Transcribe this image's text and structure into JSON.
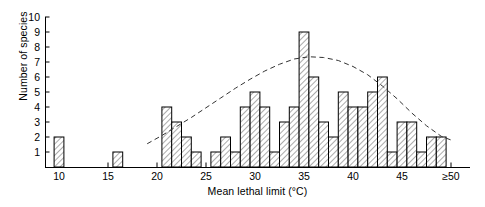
{
  "chart_data": {
    "type": "bar",
    "title": "",
    "subtitle": "",
    "xlabel": "Mean lethal limit (°C)",
    "ylabel": "Number of species",
    "grid": false,
    "legend": false,
    "xlim": [
      8,
      51
    ],
    "ylim": [
      0,
      10
    ],
    "ytick_labels": [
      "1",
      "2",
      "3",
      "4",
      "5",
      "6",
      "7",
      "8",
      "9",
      "10"
    ],
    "ytick_values": [
      1,
      2,
      3,
      4,
      5,
      6,
      7,
      8,
      9,
      10
    ],
    "xtick_labels": [
      "10",
      "15",
      "20",
      "25",
      "30",
      "35",
      "40",
      "45",
      "≥50"
    ],
    "xtick_values": [
      10,
      15,
      20,
      25,
      30,
      35,
      40,
      45,
      50
    ],
    "bin_width": 1,
    "categories": [
      10,
      16,
      21,
      22,
      23,
      24,
      26,
      27,
      28,
      29,
      30,
      31,
      32,
      33,
      34,
      35,
      36,
      37,
      38,
      39,
      40,
      41,
      42,
      43,
      44,
      45,
      46,
      47,
      48,
      49
    ],
    "values": [
      2,
      1,
      4,
      3,
      2,
      1,
      1,
      2,
      1,
      4,
      5,
      4,
      1,
      3,
      4,
      9,
      6,
      3,
      2,
      5,
      4,
      4,
      5,
      6,
      1,
      3,
      3,
      1,
      2,
      2
    ],
    "bar_style": {
      "fill": "#ffffff",
      "hatch": "diagonal",
      "hatch_color": "#555555",
      "edge_color": "#000000"
    },
    "overlay_curve": {
      "name": "fitted normal curve",
      "style": "dashed",
      "color": "#333333",
      "x": [
        19.0,
        20.5,
        22.0,
        23.5,
        25.0,
        26.5,
        28.0,
        29.5,
        31.0,
        32.5,
        34.0,
        35.5,
        37.0,
        38.5,
        40.0,
        41.5,
        43.0,
        44.5,
        46.0,
        47.5,
        49.0,
        50.0
      ],
      "y": [
        1.55,
        2.1,
        2.7,
        3.3,
        3.95,
        4.6,
        5.25,
        5.85,
        6.4,
        6.85,
        7.2,
        7.35,
        7.3,
        7.1,
        6.7,
        6.15,
        5.4,
        4.55,
        3.6,
        2.75,
        2.05,
        1.8
      ]
    }
  },
  "axes": {
    "ylabel": "Number of species",
    "xlabel": "Mean lethal limit (°C)"
  }
}
